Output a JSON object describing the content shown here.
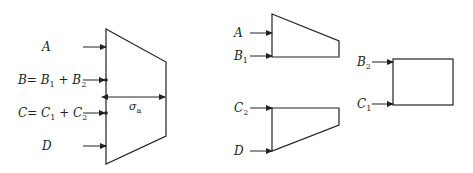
{
  "figure": {
    "left_diagram": {
      "labels": {
        "A": "A",
        "B": "B",
        "B_eq": "= ",
        "B1": "B",
        "B1_sub": "1",
        "plus1": " + ",
        "B2": "B",
        "B2_sub": "2",
        "C": "C",
        "C_eq": "= ",
        "C1": "C",
        "C1_sub": "1",
        "plus2": " + ",
        "C2": "C",
        "C2_sub": "2",
        "D": "D",
        "sigma": "σ",
        "sigma_sub": "a"
      }
    },
    "middle_top": {
      "labels": {
        "A": "A",
        "B1": "B",
        "B1_sub": "1"
      }
    },
    "middle_bottom": {
      "labels": {
        "C2": "C",
        "C2_sub": "2",
        "D": "D"
      }
    },
    "right_rect": {
      "labels": {
        "B2": "B",
        "B2_sub": "2",
        "C1": "C",
        "C1_sub": "1"
      }
    },
    "colors": {
      "line": "#222222",
      "background": "#ffffff"
    }
  }
}
